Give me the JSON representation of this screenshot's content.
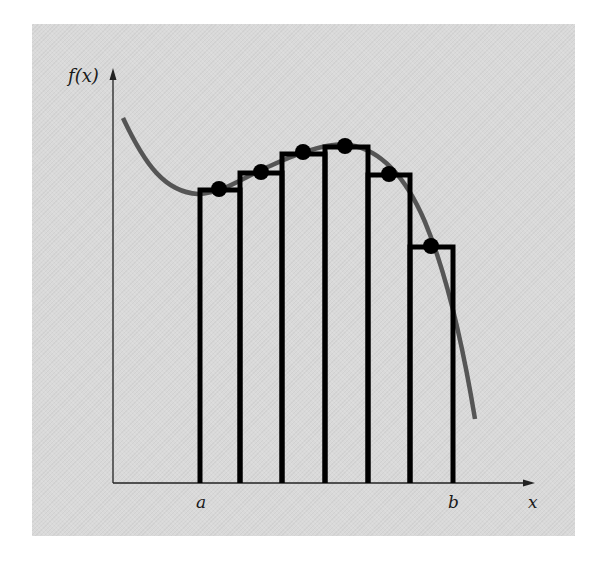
{
  "figure": {
    "y_axis_label": "f(x)",
    "x_axis_label": "x",
    "interval_start_label": "a",
    "interval_end_label": "b",
    "background_color": "#d9d9d9",
    "curve_color": "#555555",
    "rect_color": "#000000"
  },
  "diagram": {
    "type": "midpoint-rule-integration",
    "num_rectangles": 6,
    "rectangles": [
      {
        "x0": 198,
        "x1": 240,
        "top": 188,
        "midpoint": [
          219,
          189
        ]
      },
      {
        "x0": 240,
        "x1": 282,
        "top": 171,
        "midpoint": [
          261,
          172
        ]
      },
      {
        "x0": 282,
        "x1": 325,
        "top": 152,
        "midpoint": [
          303,
          152
        ]
      },
      {
        "x0": 325,
        "x1": 368,
        "top": 145,
        "midpoint": [
          345,
          146
        ]
      },
      {
        "x0": 368,
        "x1": 410,
        "top": 173,
        "midpoint": [
          389,
          174
        ]
      },
      {
        "x0": 410,
        "x1": 453,
        "top": 245,
        "midpoint": [
          431,
          246
        ]
      }
    ]
  }
}
